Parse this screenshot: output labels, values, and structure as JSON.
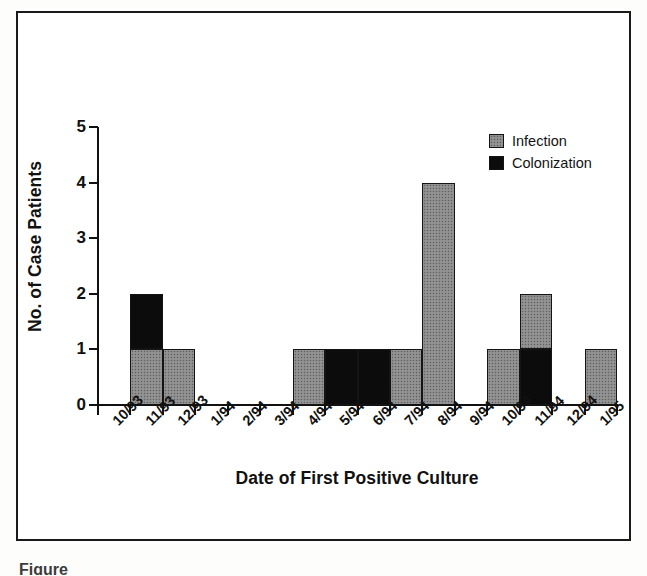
{
  "figure": {
    "caption_remnant": "Figure"
  },
  "chart_data": {
    "type": "bar",
    "title": "",
    "xlabel": "Date of First Positive Culture",
    "ylabel": "No. of Case Patients",
    "ylim": [
      0,
      5
    ],
    "y_ticks": [
      0,
      1,
      2,
      3,
      4,
      5
    ],
    "grid": false,
    "stacked": true,
    "legend_position": "top-right",
    "categories": [
      "10/93",
      "11/93",
      "12/93",
      "1/94",
      "2/94",
      "3/94",
      "4/94",
      "5/94",
      "6/94",
      "7/94",
      "8/94",
      "9/94",
      "10/94",
      "11/94",
      "12/94",
      "1/95"
    ],
    "series": [
      {
        "name": "Infection",
        "color": "#8b8b8b",
        "values": [
          0,
          1,
          1,
          0,
          0,
          0,
          1,
          0,
          0,
          1,
          4,
          0,
          1,
          1,
          0,
          1
        ]
      },
      {
        "name": "Colonization",
        "color": "#0c0c0c",
        "values": [
          0,
          1,
          0,
          0,
          0,
          0,
          0,
          1,
          1,
          0,
          0,
          0,
          0,
          1,
          0,
          0
        ]
      }
    ],
    "totals": [
      0,
      2,
      1,
      0,
      0,
      0,
      1,
      1,
      1,
      1,
      4,
      0,
      1,
      2,
      0,
      1
    ]
  },
  "legend": {
    "items": [
      {
        "label": "Infection",
        "color": "#8b8b8b"
      },
      {
        "label": "Colonization",
        "color": "#0c0c0c"
      }
    ]
  }
}
